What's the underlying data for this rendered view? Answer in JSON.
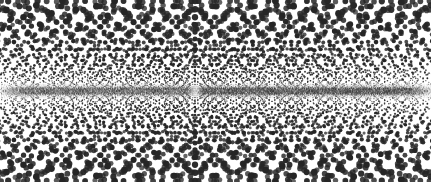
{
  "figure": {
    "title": "",
    "background_color": "#ffffff",
    "dot_color": "#262626",
    "width": 431,
    "height": 182
  },
  "chart_data": {
    "type": "scatter",
    "title": "",
    "subtitle": "",
    "xlabel": "",
    "ylabel": "",
    "xlim": [
      0,
      431
    ],
    "ylim": [
      0,
      182
    ],
    "grid": false,
    "legend": false,
    "legend_position": "none",
    "axis_visible": false,
    "tick_labels_x": [],
    "tick_labels_y": [],
    "annotations": [],
    "symmetry_axis_y": 91,
    "central_focus_x": 195,
    "central_gap_halfwidth": 7,
    "node_spacing": 38.5,
    "node_count": 12,
    "nodes_x": [
      4.5,
      43,
      81.5,
      118,
      156.5,
      195,
      233.5,
      272,
      310.5,
      349,
      387.5,
      426
    ],
    "primary_node_strength": [
      0.55,
      0.7,
      0.78,
      1.0,
      0.78,
      1.3,
      0.78,
      1.0,
      0.78,
      0.7,
      0.55,
      0.45
    ],
    "ray_count_per_node": 13,
    "ray_slopes": [
      0.055,
      0.085,
      0.12,
      0.16,
      0.21,
      0.27,
      0.34,
      0.43,
      0.54,
      0.68,
      0.86,
      1.12,
      1.5
    ],
    "dots_per_ray": 26,
    "dot_radius_min": 0.35,
    "dot_radius_max": 3.1,
    "dot_radius_growth": 1.0,
    "band_density_rows": 46,
    "band_half_height": 7,
    "band_dot_radius": 0.55,
    "series": [
      {
        "name": "fan-rays",
        "point_count_approx": 4050,
        "color": "#262626"
      },
      {
        "name": "central-band",
        "point_count_approx": 5200,
        "color": "#303030"
      }
    ]
  }
}
